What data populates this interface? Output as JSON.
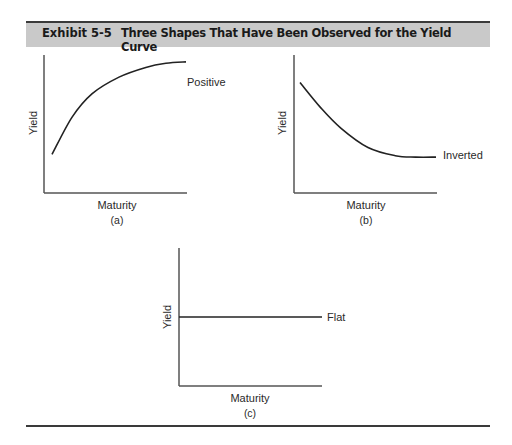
{
  "header": {
    "exhibit_label": "Exhibit 5-5",
    "title": "Three Shapes That Have Been Observed for the Yield Curve",
    "band_color": "#c9c9c9"
  },
  "chart_data": [
    {
      "type": "line",
      "panel": "(a)",
      "shape": "Positive",
      "curve_label": "Positive",
      "xlabel": "Maturity",
      "ylabel": "Yield",
      "description": "Upward sloping, concave curve rising steeply at short maturities then flattening at long maturities",
      "x": [
        0,
        0.15,
        0.3,
        0.5,
        0.7,
        0.85,
        1.0
      ],
      "y": [
        0.28,
        0.55,
        0.72,
        0.84,
        0.91,
        0.94,
        0.95
      ],
      "xlim": [
        0,
        1
      ],
      "ylim": [
        0,
        1
      ],
      "grid": false
    },
    {
      "type": "line",
      "panel": "(b)",
      "shape": "Inverted",
      "curve_label": "Inverted",
      "xlabel": "Maturity",
      "ylabel": "Yield",
      "description": "Downward sloping, convex curve falling from high short-term yields and leveling off at long maturities",
      "x": [
        0,
        0.15,
        0.3,
        0.5,
        0.7,
        0.85,
        1.0
      ],
      "y": [
        0.8,
        0.62,
        0.47,
        0.33,
        0.27,
        0.26,
        0.26
      ],
      "xlim": [
        0,
        1
      ],
      "ylim": [
        0,
        1
      ],
      "grid": false
    },
    {
      "type": "line",
      "panel": "(c)",
      "shape": "Flat",
      "curve_label": "Flat",
      "xlabel": "Maturity",
      "ylabel": "Yield",
      "description": "Horizontal line: yield constant across maturities",
      "x": [
        0,
        1.0
      ],
      "y": [
        0.5,
        0.5
      ],
      "xlim": [
        0,
        1
      ],
      "ylim": [
        0,
        1
      ],
      "grid": false
    }
  ]
}
